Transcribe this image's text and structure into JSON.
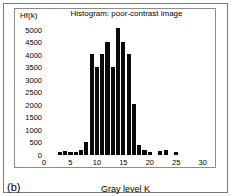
{
  "figure": {
    "panel_label": "(b)",
    "frame_color": "#7a7a7a",
    "bar_color": "#0a0a0a",
    "background": "#ffffff"
  },
  "chart_data": {
    "type": "bar",
    "title": "Histogram: poor-contrast image",
    "xlabel": "Gray level K",
    "ylabel": "Hf(k)",
    "xlim": [
      0,
      31
    ],
    "ylim": [
      0,
      5300
    ],
    "grid": false,
    "legend": "none",
    "xticks": [
      0,
      5,
      10,
      15,
      20,
      25,
      30
    ],
    "yticks": [
      0,
      500,
      1000,
      1500,
      2000,
      2500,
      3000,
      3500,
      4000,
      4500,
      5000
    ],
    "categories": [
      3,
      4,
      5,
      6,
      7,
      8,
      9,
      10,
      11,
      12,
      13,
      14,
      15,
      16,
      17,
      18,
      19,
      20,
      22,
      23,
      25
    ],
    "values": [
      140,
      170,
      130,
      120,
      180,
      500,
      4030,
      3520,
      4030,
      4520,
      3520,
      5050,
      4520,
      4030,
      2030,
      400,
      190,
      110,
      150,
      190,
      110
    ]
  }
}
